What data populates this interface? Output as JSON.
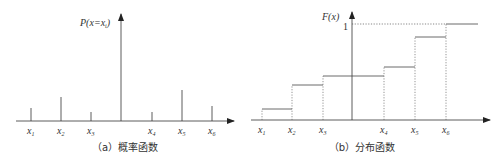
{
  "panel_a": {
    "ylabel": "P(x=xᵢ)",
    "ylabel_main": "P(x=x",
    "ylabel_sub": "i",
    "ylabel_end": ")",
    "caption": "（a）概率函数",
    "stems": [
      {
        "label": "x",
        "sub": "1",
        "x": 31,
        "top": 108
      },
      {
        "label": "x",
        "sub": "2",
        "x": 61,
        "top": 97
      },
      {
        "label": "x",
        "sub": "3",
        "x": 91,
        "top": 112
      },
      {
        "label": "x",
        "sub": "4",
        "x": 152,
        "top": 112
      },
      {
        "label": "x",
        "sub": "5",
        "x": 182,
        "top": 90
      },
      {
        "label": "x",
        "sub": "6",
        "x": 212,
        "top": 106
      }
    ]
  },
  "panel_b": {
    "ylabel": "F(x)",
    "level_one_label": "1",
    "caption": "（b）分布函数",
    "steps": [
      {
        "label": "x",
        "sub": "1",
        "x": 262,
        "level": 109
      },
      {
        "label": "x",
        "sub": "2",
        "x": 292,
        "level": 85
      },
      {
        "label": "x",
        "sub": "3",
        "x": 323,
        "level": 76
      },
      {
        "label": "x",
        "sub": "4",
        "x": 384,
        "level": 67
      },
      {
        "label": "x",
        "sub": "5",
        "x": 415,
        "level": 37
      },
      {
        "label": "x",
        "sub": "6",
        "x": 446,
        "level": 24
      }
    ]
  },
  "colors": {
    "line": "#333333",
    "text": "#333333"
  }
}
